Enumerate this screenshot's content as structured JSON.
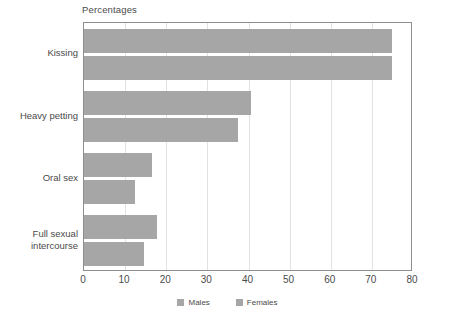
{
  "chart_data": {
    "type": "bar",
    "orientation": "horizontal",
    "title": "Percentages",
    "xlabel": "",
    "ylabel": "",
    "xlim": [
      0,
      80
    ],
    "xticks": [
      0,
      10,
      20,
      30,
      40,
      50,
      60,
      70,
      80
    ],
    "xtick_labels": [
      "0",
      "10",
      "20",
      "30",
      "40",
      "50",
      "60",
      "70",
      "80"
    ],
    "grid": "vertical",
    "legend_position": "bottom-center",
    "categories": [
      "Kissing",
      "Heavy petting",
      "Oral sex",
      "Full sexual\nintercourse"
    ],
    "series": [
      {
        "name": "Males",
        "color": "#a6a6a6",
        "values": [
          75,
          40.5,
          16.5,
          17.8
        ]
      },
      {
        "name": "Females",
        "color": "#a6a6a6",
        "values": [
          75,
          37.5,
          12.5,
          14.7
        ]
      }
    ]
  },
  "legend": {
    "items": [
      {
        "label": "Males"
      },
      {
        "label": "Females"
      }
    ]
  },
  "colors": {
    "bar": "#a6a6a6",
    "grid": "#e2e2e2",
    "axis": "#8d8d8d",
    "text": "#4a4a4a",
    "background": "#ffffff"
  }
}
